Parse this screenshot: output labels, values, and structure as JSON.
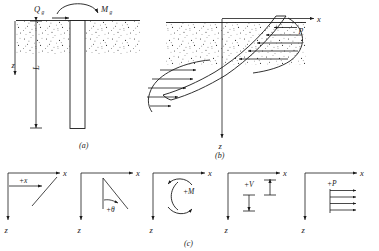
{
  "figure": {
    "panels": [
      {
        "id": "a",
        "caption": "(a)",
        "name": "pile-elevation-panel",
        "labels": {
          "lateral_load": "Q",
          "lateral_load_sub": "g",
          "moment": "M",
          "moment_sub": "g",
          "depth_axis": "z",
          "length": "L"
        }
      },
      {
        "id": "b",
        "caption": "(b)",
        "name": "deflected-pile-panel",
        "labels": {
          "x_axis": "x",
          "z_axis": "z",
          "soil_reaction": "p"
        }
      },
      {
        "id": "c",
        "caption": "(c)",
        "name": "sign-convention-panel",
        "conventions": [
          {
            "key": "deflection",
            "label": "+x",
            "axis_x": "x",
            "axis_z": "z"
          },
          {
            "key": "slope",
            "label": "+θ",
            "axis_x": "x",
            "axis_z": "z"
          },
          {
            "key": "moment",
            "label": "+M",
            "axis_x": "x",
            "axis_z": "z"
          },
          {
            "key": "shear",
            "label": "+V",
            "axis_x": "x",
            "axis_z": "z"
          },
          {
            "key": "soil-reaction",
            "label": "+P",
            "axis_x": "x",
            "axis_z": "z"
          }
        ]
      }
    ],
    "colors": {
      "ink": "#1a1a1a",
      "background": "#ffffff",
      "soil_stipple": "#3a3a3a"
    }
  }
}
